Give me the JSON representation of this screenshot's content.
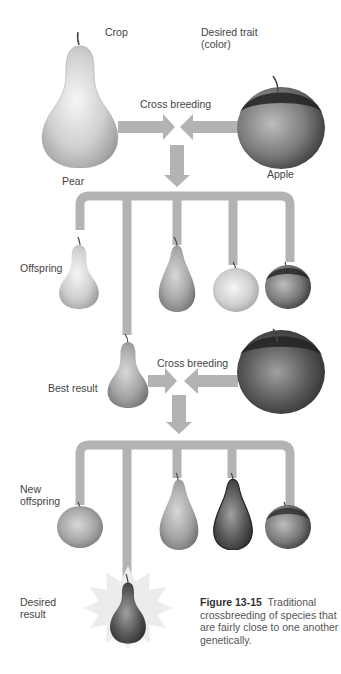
{
  "labels": {
    "crop": "Crop",
    "desired_trait_1": "Desired trait",
    "desired_trait_2": "(color)",
    "cross_breeding_1": "Cross breeding",
    "pear": "Pear",
    "apple": "Apple",
    "offspring": "Offspring",
    "best_result": "Best result",
    "cross_breeding_2": "Cross breeding",
    "new_offspring_1": "New",
    "new_offspring_2": "offspring",
    "desired_result_1": "Desired",
    "desired_result_2": "result"
  },
  "caption": {
    "figure_number": "Figure 13-15",
    "text": "Traditional crossbreeding of species that are fairly close to one another genetically."
  },
  "colors": {
    "connector": "#b3b3b3",
    "pear_light": "#eeeeee",
    "pear_mid": "#a8a8a8",
    "apple_dark": "#2e2e2e",
    "burst": "#ececec"
  }
}
